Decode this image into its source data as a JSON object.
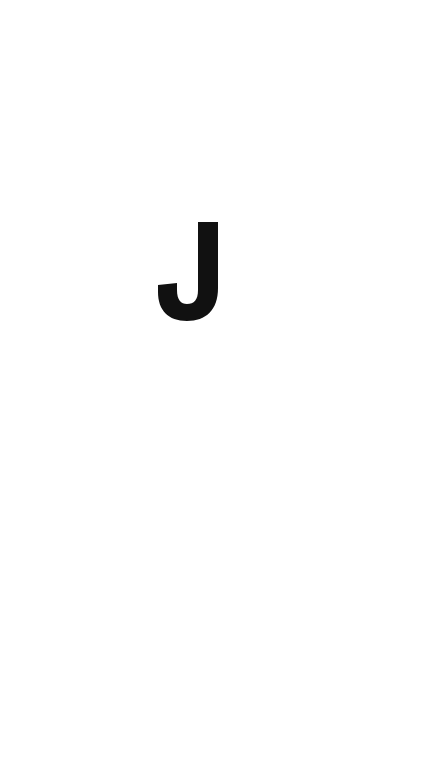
{
  "splash": {
    "logo_letter": "J",
    "logo_color": "#111111",
    "background_color": "#ffffff"
  }
}
